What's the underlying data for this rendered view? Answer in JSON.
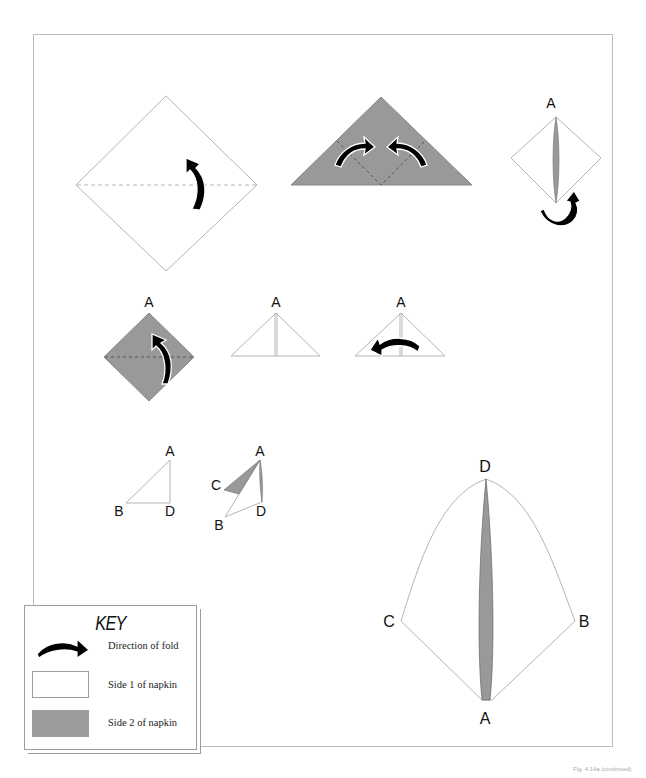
{
  "diagram": {
    "kind": "napkin-folding-instructions",
    "colors": {
      "side1": "#ffffff",
      "side2": "#999999",
      "outline": "#a8a8a8",
      "arrow": "#000000"
    },
    "steps": [
      {
        "step": 1,
        "shape": "square-diamond",
        "side": "side1",
        "fold_line": "horizontal-dashed",
        "arrow": "up"
      },
      {
        "step": 2,
        "shape": "triangle",
        "side": "side2",
        "fold_lines": "two-diagonal-dashed",
        "arrows": [
          "left-to-center",
          "right-to-center"
        ]
      },
      {
        "step": 3,
        "shape": "diamond-with-center-slit",
        "side": "side1",
        "labels": [
          "A"
        ],
        "arrow": "turn-over"
      },
      {
        "step": 4,
        "shape": "square-diamond",
        "side": "side2",
        "fold_line": "horizontal-dashed",
        "labels": [
          "A"
        ],
        "arrow": "up"
      },
      {
        "step": 5,
        "shape": "triangle-center-seam",
        "side": "side1",
        "labels": [
          "A"
        ]
      },
      {
        "step": 6,
        "shape": "triangle-center-seam",
        "side": "side1",
        "labels": [
          "A"
        ],
        "arrow": "left"
      },
      {
        "step": 7,
        "shape": "right-triangle",
        "side": "side1",
        "labels": [
          "A",
          "B",
          "D"
        ]
      },
      {
        "step": 8,
        "shape": "opened-triangle",
        "side": "mixed",
        "labels": [
          "A",
          "C",
          "B",
          "D"
        ]
      },
      {
        "step": 9,
        "shape": "finished-fan",
        "side": "mixed",
        "labels": [
          "D",
          "C",
          "B",
          "A"
        ]
      }
    ],
    "labels": {
      "a": "A",
      "b": "B",
      "c": "C",
      "d": "D"
    }
  },
  "key": {
    "title": "KEY",
    "rows": [
      {
        "icon": "fold-arrow-icon",
        "label": "Direction of fold"
      },
      {
        "icon": "white-swatch",
        "label": "Side 1 of napkin"
      },
      {
        "icon": "gray-swatch",
        "label": "Side 2 of napkin"
      }
    ]
  },
  "footer": {
    "caption": "Fig. 4.14a (continued)"
  }
}
